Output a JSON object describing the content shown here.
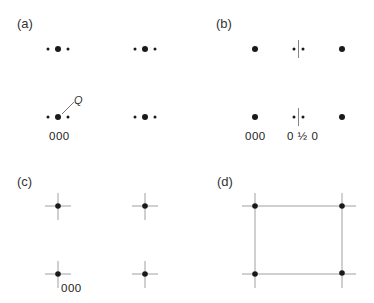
{
  "panels": {
    "a": {
      "label": "(a)",
      "origin_index": "000",
      "annotation": "Q"
    },
    "b": {
      "label": "(b)",
      "origin_index": "000",
      "half_index": "0 ½ 0"
    },
    "c": {
      "label": "(c)",
      "origin_index": "000"
    },
    "d": {
      "label": "(d)"
    }
  },
  "colors": {
    "spot": "#1a1a1a",
    "line": "#888888",
    "text": "#333333"
  }
}
